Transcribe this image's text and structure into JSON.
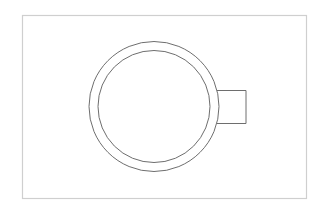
{
  "diagram": {
    "title": "",
    "colors": {
      "background": "#ffffff",
      "frame": "#cfcfcf",
      "stroke": "#6e6e6e"
    },
    "frame": {
      "x": 22.5,
      "y": 15.5,
      "width": 284,
      "height": 183
    },
    "outer_circle": {
      "cx": 154,
      "cy": 106.5,
      "r": 65
    },
    "inner_circle": {
      "cx": 154,
      "cy": 106.5,
      "r": 56
    },
    "handle": {
      "x": 219,
      "y": 90.5,
      "width": 27,
      "height": 33
    }
  }
}
